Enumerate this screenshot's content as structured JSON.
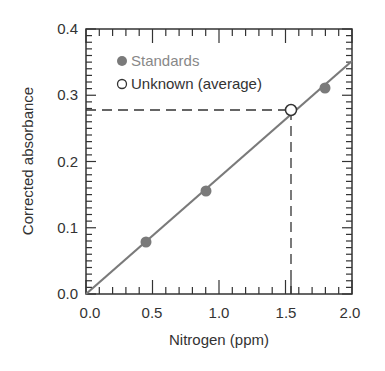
{
  "chart_data": {
    "type": "scatter",
    "title": "",
    "xlabel": "Nitrogen (ppm)",
    "ylabel": "Corrected absorbance",
    "xlim": [
      0.0,
      2.0
    ],
    "ylim": [
      0.0,
      0.4
    ],
    "x_ticks": [
      "0.0",
      "0.5",
      "1.0",
      "1.5",
      "2.0"
    ],
    "y_ticks": [
      "0.0",
      "0.1",
      "0.2",
      "0.3",
      "0.4"
    ],
    "grid": false,
    "legend_position": "upper left",
    "series": [
      {
        "name": "Standards",
        "marker": "filled-circle",
        "color": "#7a7a7a",
        "x": [
          0.45,
          0.9,
          1.8
        ],
        "y": [
          0.078,
          0.155,
          0.31
        ]
      },
      {
        "name": "Unknown (average)",
        "marker": "open-circle",
        "color": "#333333",
        "x": [
          1.54
        ],
        "y": [
          0.277
        ]
      }
    ],
    "fit_line": {
      "color": "#7a7a7a",
      "x": [
        0.0,
        2.0
      ],
      "y": [
        0.0,
        0.352
      ]
    },
    "annotations": [
      {
        "type": "dashed-horizontal",
        "y": 0.277,
        "x_from": 0.0,
        "x_to": 1.54
      },
      {
        "type": "dashed-vertical",
        "x": 1.54,
        "y_from": 0.0,
        "y_to": 0.277
      }
    ]
  },
  "legend": {
    "standards": "Standards",
    "unknown": "Unknown (average)"
  },
  "axes": {
    "xlabel": "Nitrogen (ppm)",
    "ylabel": "Corrected absorbance",
    "x_ticks": [
      "0.0",
      "0.5",
      "1.0",
      "1.5",
      "2.0"
    ],
    "y_ticks": [
      "0.0",
      "0.1",
      "0.2",
      "0.3",
      "0.4"
    ]
  }
}
